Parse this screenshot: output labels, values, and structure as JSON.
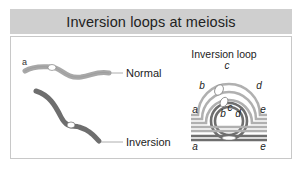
{
  "header": {
    "title": "Inversion loops at meiosis"
  },
  "left_panel": {
    "chromosome_normal": {
      "label": "Normal",
      "end_label": "a",
      "color": "#a8a8a8"
    },
    "chromosome_inversion": {
      "label": "Inversion",
      "color": "#707070"
    }
  },
  "right_panel": {
    "title": "Inversion loop",
    "segment_labels": {
      "outer_a": "a",
      "outer_b": "b",
      "outer_c": "c",
      "outer_d": "d",
      "outer_e": "e",
      "inner_b": "b",
      "inner_c": "c",
      "inner_d": "d",
      "bottom_a": "a",
      "bottom_e": "e"
    },
    "colors": {
      "light_strand": "#b0b0b0",
      "dark_strand": "#6e6e6e",
      "centromere": "#ffffff"
    }
  },
  "colors": {
    "header_bg": "#cfcfcf",
    "panel_border": "#c8c8c8",
    "text": "#222222"
  }
}
